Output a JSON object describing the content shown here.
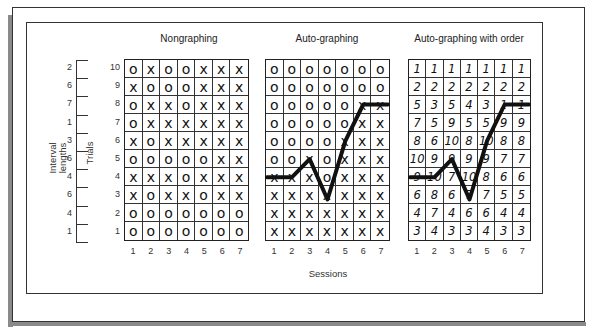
{
  "figure": {
    "panels": [
      {
        "title": "Nongraphing",
        "rows": [
          [
            "O",
            "X",
            "O",
            "O",
            "X",
            "X",
            "X"
          ],
          [
            "X",
            "O",
            "O",
            "O",
            "X",
            "X",
            "X"
          ],
          [
            "O",
            "X",
            "X",
            "O",
            "X",
            "X",
            "X"
          ],
          [
            "O",
            "X",
            "X",
            "X",
            "X",
            "X",
            "X"
          ],
          [
            "X",
            "O",
            "X",
            "X",
            "X",
            "X",
            "X"
          ],
          [
            "O",
            "O",
            "O",
            "O",
            "O",
            "X",
            "X"
          ],
          [
            "X",
            "X",
            "X",
            "O",
            "X",
            "X",
            "X"
          ],
          [
            "X",
            "O",
            "X",
            "X",
            "O",
            "X",
            "X"
          ],
          [
            "O",
            "O",
            "O",
            "O",
            "O",
            "O",
            "O"
          ],
          [
            "O",
            "O",
            "O",
            "O",
            "O",
            "O",
            "O"
          ]
        ]
      },
      {
        "title": "Auto-graphing",
        "rows": [
          [
            "O",
            "O",
            "O",
            "O",
            "O",
            "O",
            "O"
          ],
          [
            "O",
            "O",
            "O",
            "O",
            "O",
            "O",
            "O"
          ],
          [
            "O",
            "O",
            "O",
            "O",
            "O",
            "X",
            "X"
          ],
          [
            "O",
            "O",
            "O",
            "O",
            "O",
            "X",
            "X"
          ],
          [
            "O",
            "O",
            "O",
            "O",
            "X",
            "X",
            "X"
          ],
          [
            "O",
            "O",
            "X",
            "O",
            "X",
            "X",
            "X"
          ],
          [
            "X",
            "X",
            "X",
            "O",
            "X",
            "X",
            "X"
          ],
          [
            "X",
            "X",
            "X",
            "X",
            "X",
            "X",
            "X"
          ],
          [
            "X",
            "X",
            "X",
            "X",
            "X",
            "X",
            "X"
          ],
          [
            "X",
            "X",
            "X",
            "X",
            "X",
            "X",
            "X"
          ]
        ]
      },
      {
        "title": "Auto-graphing with order",
        "rows": [
          [
            "1",
            "1",
            "1",
            "1",
            "1",
            "1",
            "1"
          ],
          [
            "2",
            "2",
            "2",
            "2",
            "2",
            "2",
            "2"
          ],
          [
            "5",
            "3",
            "5",
            "4",
            "3",
            "1",
            "1"
          ],
          [
            "7",
            "5",
            "9",
            "5",
            "5",
            "9",
            "9"
          ],
          [
            "8",
            "6",
            "10",
            "8",
            "10",
            "8",
            "8"
          ],
          [
            "10",
            "9",
            "9",
            "9",
            "9",
            "7",
            "7"
          ],
          [
            "9",
            "10",
            "7",
            "10",
            "8",
            "6",
            "6"
          ],
          [
            "6",
            "8",
            "6",
            "7",
            "7",
            "5",
            "5"
          ],
          [
            "4",
            "7",
            "4",
            "6",
            "6",
            "4",
            "4"
          ],
          [
            "3",
            "4",
            "3",
            "3",
            "4",
            "3",
            "3"
          ]
        ]
      }
    ],
    "trials": [
      "10",
      "9",
      "8",
      "7",
      "6",
      "5",
      "4",
      "3",
      "2",
      "1"
    ],
    "interval_lengths": [
      "2",
      "6",
      "7",
      "1",
      "3",
      "6",
      "4",
      "6",
      "4",
      "1"
    ],
    "interval_label": "Interval lengths",
    "trials_label": "Trials",
    "sessions": [
      "1",
      "2",
      "3",
      "4",
      "5",
      "6",
      "7"
    ],
    "sessions_label": "Sessions",
    "graph_line_trial_values": [
      4,
      4,
      5,
      3,
      6,
      8,
      8
    ]
  },
  "chart_data": {
    "type": "table",
    "xlabel": "Sessions",
    "ylabel": "Trials",
    "categories": [
      "1",
      "2",
      "3",
      "4",
      "5",
      "6",
      "7"
    ],
    "series": [
      {
        "name": "Auto-graphing line (trial level)",
        "values": [
          4,
          4,
          5,
          3,
          6,
          8,
          8
        ]
      },
      {
        "name": "Auto-graphing with order line (trial level)",
        "values": [
          4,
          4,
          5,
          3,
          6,
          8,
          8
        ]
      }
    ],
    "interval_lengths_by_trial_top_to_bottom": [
      2,
      6,
      7,
      1,
      3,
      6,
      4,
      6,
      4,
      1
    ]
  }
}
